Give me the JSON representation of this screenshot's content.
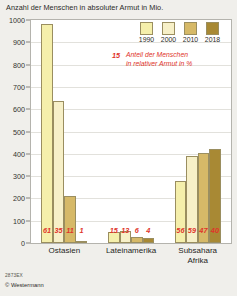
{
  "chart_data": {
    "type": "bar",
    "title": "Anzahl der Menschen in absoluter Armut in Mio.",
    "xlabel": "",
    "ylabel": "",
    "ylim": [
      0,
      1000
    ],
    "yticks": [
      0,
      100,
      200,
      300,
      400,
      500,
      600,
      700,
      800,
      900,
      1000
    ],
    "grid": true,
    "legend_position": "top-right",
    "categories": [
      "Ostasien",
      "Lateinamerika",
      "Subsahara Afrika"
    ],
    "series": [
      {
        "name": "1990",
        "color": "#f5efab",
        "values": [
          980,
          48,
          278
        ]
      },
      {
        "name": "2000",
        "color": "#f7f0c8",
        "values": [
          635,
          52,
          388
        ]
      },
      {
        "name": "2010",
        "color": "#d6b968",
        "values": [
          210,
          26,
          405
        ]
      },
      {
        "name": "2018",
        "color": "#a88934",
        "values": [
          8,
          22,
          423
        ]
      }
    ],
    "annotation_series": {
      "name": "Anteil der Menschen in relativer Armut in %",
      "color": "#e0342a",
      "sample_value": "15",
      "values": [
        [
          "61",
          "35",
          "11",
          "1"
        ],
        [
          "15",
          "13",
          "6",
          "4"
        ],
        [
          "56",
          "59",
          "47",
          "40"
        ]
      ]
    }
  },
  "legend": {
    "items": [
      {
        "label": "1990"
      },
      {
        "label": "2000"
      },
      {
        "label": "2010"
      },
      {
        "label": "2018"
      }
    ]
  },
  "annotation": {
    "key": "15",
    "line1": "Anteil der Menschen",
    "line2": "in relativer Armut in %"
  },
  "categories": [
    {
      "line1": "Ostasien",
      "line2": ""
    },
    {
      "line1": "Lateinamerika",
      "line2": ""
    },
    {
      "line1": "Subsahara",
      "line2": "Afrika"
    }
  ],
  "footer": {
    "code": "2873EX",
    "copyright": "© Westermann"
  }
}
